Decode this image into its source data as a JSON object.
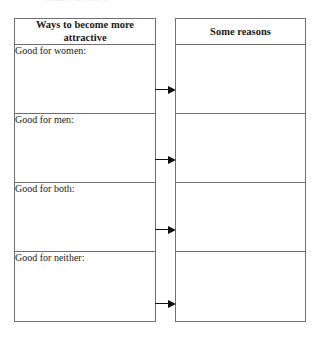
{
  "page": {
    "clipped_top_text": "outline the above.",
    "ink_color": "#1a1a1a",
    "border_color": "#6f6f6f"
  },
  "left_table": {
    "header": "Ways to become more attractive",
    "rows": [
      {
        "label": "Good for women:"
      },
      {
        "label": "Good for men:"
      },
      {
        "label": "Good for both:"
      },
      {
        "label": "Good for neither:"
      }
    ]
  },
  "right_table": {
    "header": "Some reasons",
    "rows": [
      {
        "value": ""
      },
      {
        "value": ""
      },
      {
        "value": ""
      },
      {
        "value": ""
      }
    ]
  },
  "connectors": [
    {
      "name": "arrow-row-1",
      "direction": "right"
    },
    {
      "name": "arrow-row-2",
      "direction": "right"
    },
    {
      "name": "arrow-row-3",
      "direction": "right"
    },
    {
      "name": "arrow-row-4",
      "direction": "right"
    }
  ]
}
